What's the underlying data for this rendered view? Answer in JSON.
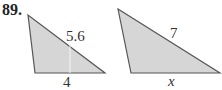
{
  "problem_number": "89.",
  "triangle_left": {
    "hypotenuse_label": "5.6",
    "base_label": "4",
    "fill": "#d6d6d6",
    "stroke": "#555555"
  },
  "triangle_right": {
    "hypotenuse_label": "7",
    "base_label": "x",
    "fill": "#d6d6d6",
    "stroke": "#555555"
  }
}
